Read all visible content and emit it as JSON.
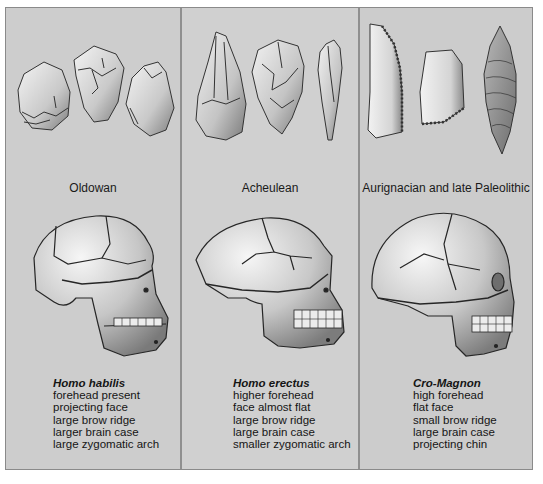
{
  "figure": {
    "panels": [
      {
        "industry": "Oldowan",
        "species": "Homo habilis",
        "traits": [
          "forehead present",
          "projecting face",
          "large brow ridge",
          "larger brain case",
          "large zygomatic arch"
        ]
      },
      {
        "industry": "Acheulean",
        "species": "Homo erectus",
        "traits": [
          "higher forehead",
          "face almost flat",
          "large brow ridge",
          "large brain case",
          "smaller zygomatic arch"
        ]
      },
      {
        "industry": "Aurignacian and late Paleolithic",
        "species": "Cro-Magnon",
        "traits": [
          "high forehead",
          "flat face",
          "small brow ridge",
          "large brain case",
          "projecting chin"
        ]
      }
    ],
    "colors": {
      "panel_bg": "#cdcdcd",
      "divider": "#8f8f8f",
      "outline": "#2a2a2a",
      "bone_light": "#f2f2f2",
      "bone_shadow": "#8c8c8c"
    }
  }
}
